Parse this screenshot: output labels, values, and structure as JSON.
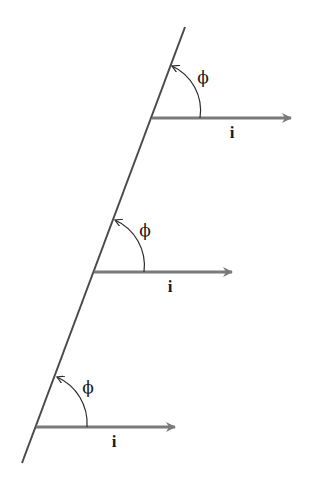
{
  "diagram": {
    "colors": {
      "line": "#4a4a4a",
      "vector": "#7a7a7a",
      "arc": "#2a2a2a",
      "text": "#1a1a1a",
      "background": "#ffffff"
    },
    "main_line": {
      "x1": 185,
      "y1": 27,
      "x2": 22,
      "y2": 463
    },
    "groups": [
      {
        "vector": {
          "x1": 152,
          "y1": 118,
          "x2": 291,
          "y2": 118
        },
        "vector_label": "i",
        "vector_label_pos": {
          "x": 232,
          "y": 138
        },
        "angle_label": "ϕ",
        "angle_label_pos": {
          "x": 203,
          "y": 83
        },
        "arc": {
          "sx": 200,
          "sy": 118,
          "ex": 172,
          "ey": 66,
          "r": 49
        }
      },
      {
        "vector": {
          "x1": 94,
          "y1": 272,
          "x2": 232,
          "y2": 272
        },
        "vector_label": "i",
        "vector_label_pos": {
          "x": 170,
          "y": 292
        },
        "angle_label": "ϕ",
        "angle_label_pos": {
          "x": 145,
          "y": 236
        },
        "arc": {
          "sx": 144,
          "sy": 272,
          "ex": 115,
          "ey": 220,
          "r": 50
        }
      },
      {
        "vector": {
          "x1": 36,
          "y1": 427,
          "x2": 175,
          "y2": 427
        },
        "vector_label": "i",
        "vector_label_pos": {
          "x": 114,
          "y": 447
        },
        "angle_label": "ϕ",
        "angle_label_pos": {
          "x": 88,
          "y": 393
        },
        "arc": {
          "sx": 87,
          "sy": 427,
          "ex": 57,
          "ey": 377,
          "r": 51
        }
      }
    ]
  }
}
